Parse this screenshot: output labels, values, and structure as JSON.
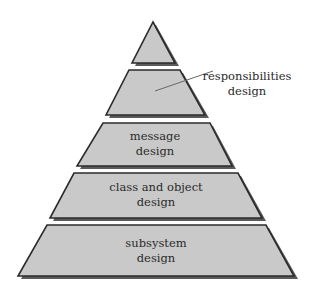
{
  "diagram": {
    "type": "pyramid",
    "colors": {
      "fill": "#c9c9c9",
      "stroke": "#2b2b2b",
      "shadow": "#5a5a5a",
      "text": "#2a2a2a",
      "leader": "#666666"
    },
    "tiers": [
      {
        "id": "apex",
        "line1": "",
        "line2": ""
      },
      {
        "id": "responsibilities",
        "line1": "responsibilities",
        "line2": "design",
        "callout": true
      },
      {
        "id": "message",
        "line1": "message",
        "line2": "design"
      },
      {
        "id": "class-object",
        "line1": "class and object",
        "line2": "design"
      },
      {
        "id": "subsystem",
        "line1": "subsystem",
        "line2": "design"
      }
    ]
  }
}
